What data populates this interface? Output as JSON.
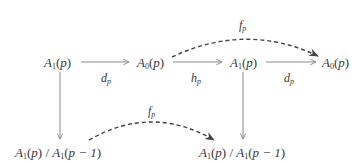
{
  "diagram": {
    "type": "commutative-diagram",
    "nodes": [
      {
        "id": "top-a1-left",
        "base": "A",
        "sub": "1",
        "arg": "p",
        "row": 0,
        "col": 0
      },
      {
        "id": "top-a0-left",
        "base": "A",
        "sub": "0",
        "arg": "p",
        "row": 0,
        "col": 1
      },
      {
        "id": "top-a1-right",
        "base": "A",
        "sub": "1",
        "arg": "p",
        "row": 0,
        "col": 2
      },
      {
        "id": "top-a0-right",
        "base": "A",
        "sub": "0",
        "arg": "p",
        "row": 0,
        "col": 3
      },
      {
        "id": "bottom-quotient-left",
        "text": "A1(p) / A1(p − 1)",
        "num_base": "A",
        "num_sub": "1",
        "num_arg": "p",
        "sep": " / ",
        "den_base": "A",
        "den_sub": "1",
        "den_arg": "p − 1",
        "row": 1,
        "col": 0
      },
      {
        "id": "bottom-quotient-right",
        "text": "A1(p) / A1(p − 1)",
        "num_base": "A",
        "num_sub": "1",
        "num_arg": "p",
        "sep": " / ",
        "den_base": "A",
        "den_sub": "1",
        "den_arg": "p − 1",
        "row": 1,
        "col": 2
      }
    ],
    "edges": [
      {
        "from": "top-a1-left",
        "to": "top-a0-left",
        "label_base": "d",
        "label_sub": "p",
        "style": "solid",
        "label_position": "below"
      },
      {
        "from": "top-a0-left",
        "to": "top-a1-right",
        "label_base": "h",
        "label_sub": "p",
        "style": "solid",
        "label_position": "below"
      },
      {
        "from": "top-a1-right",
        "to": "top-a0-right",
        "label_base": "d",
        "label_sub": "p",
        "style": "solid",
        "label_position": "below"
      },
      {
        "from": "top-a0-left",
        "to": "top-a0-right",
        "label_base": "f",
        "label_sub": "p",
        "style": "dashed-curved",
        "label_position": "above"
      },
      {
        "from": "top-a1-left",
        "to": "bottom-quotient-left",
        "label_base": "",
        "label_sub": "",
        "style": "solid"
      },
      {
        "from": "top-a1-right",
        "to": "bottom-quotient-right",
        "label_base": "",
        "label_sub": "",
        "style": "solid"
      },
      {
        "from": "bottom-quotient-left",
        "to": "bottom-quotient-right",
        "label_base": "f",
        "label_sub": "p",
        "style": "dashed-curved",
        "label_position": "above"
      }
    ],
    "colors": {
      "solid_arrow": "#8a8a8a",
      "dashed_arrow": "#444444",
      "text": "#3a3a3a"
    }
  }
}
